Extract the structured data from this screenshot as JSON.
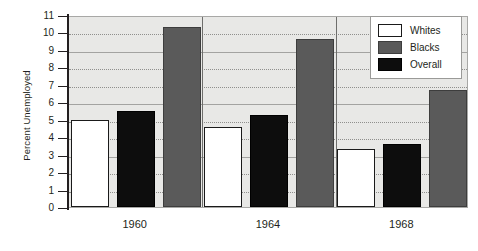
{
  "chart_data": {
    "type": "bar",
    "title": "",
    "subtitle": "",
    "xlabel": "",
    "ylabel": "Percent Unemployed",
    "categories": [
      "1960",
      "1964",
      "1968"
    ],
    "series": [
      {
        "name": "Whites",
        "color": "#ffffff",
        "values": [
          5.0,
          4.6,
          3.3
        ]
      },
      {
        "name": "Blacks",
        "color": "#5a5a5a",
        "values": [
          10.3,
          9.6,
          6.7
        ]
      },
      {
        "name": "Overall",
        "color": "#0d0d0d",
        "values": [
          5.5,
          5.3,
          3.6
        ]
      }
    ],
    "bar_order_in_group": [
      "Whites",
      "Overall",
      "Blacks"
    ],
    "ylim": [
      0,
      11
    ],
    "ytick_labels": [
      "0",
      "1",
      "2",
      "3",
      "4",
      "5",
      "6",
      "7",
      "8",
      "9",
      "10",
      "11"
    ],
    "ytick_values": [
      0,
      1,
      2,
      3,
      4,
      5,
      6,
      7,
      8,
      9,
      10,
      11
    ],
    "grid": true,
    "grid_axis": "y",
    "legend_position": "top-right",
    "plot_background": "#e8e8e6"
  },
  "legend": {
    "items": [
      {
        "label": "Whites",
        "swatch": "whites"
      },
      {
        "label": "Blacks",
        "swatch": "blacks"
      },
      {
        "label": "Overall",
        "swatch": "overall"
      }
    ]
  }
}
